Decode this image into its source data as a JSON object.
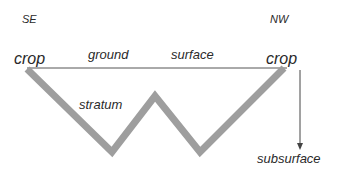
{
  "labels": {
    "se": "SE",
    "nw": "NW",
    "crop_left": "crop",
    "crop_right": "crop",
    "ground": "ground",
    "surface": "surface",
    "stratum": "stratum",
    "subsurface": "subsurface"
  },
  "colors": {
    "stratum": "#9e9e9e",
    "ground_line": "#555555",
    "arrow": "#444444",
    "text": "#2a2a2a"
  }
}
